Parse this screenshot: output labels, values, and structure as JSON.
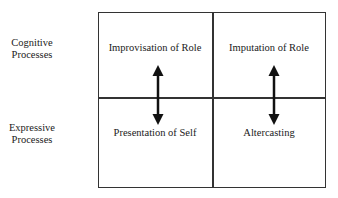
{
  "rows": [
    {
      "line1": "Cognitive",
      "line2": "Processes"
    },
    {
      "line1": "Expressive",
      "line2": "Processes"
    }
  ],
  "cells": {
    "top_left": "Improvisation of Role",
    "top_right": "Imputation of Role",
    "bottom_left": "Presentation of Self",
    "bottom_right": "Altercasting"
  },
  "arrows": [
    {
      "name": "improvisation-presentation",
      "type": "bidirectional"
    },
    {
      "name": "imputation-altercasting",
      "type": "bidirectional"
    }
  ],
  "colors": {
    "line": "#333333",
    "arrow": "#111111",
    "background": "#ffffff"
  }
}
